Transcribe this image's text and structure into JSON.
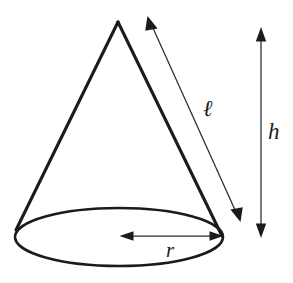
{
  "figure": {
    "kind": "geometry-diagram",
    "shape": "cone",
    "background_color": "#ffffff",
    "stroke_color": "#1b1b1b",
    "label_color": "#1a1a1a"
  },
  "labels": {
    "slant_height": "ℓ",
    "height": "h",
    "radius": "r"
  },
  "geometry": {
    "apex": {
      "x": 118,
      "y": 22
    },
    "base_ellipse": {
      "cx": 119,
      "cy": 237,
      "rx": 104,
      "ry": 29
    },
    "left_base_point": {
      "x": 16,
      "y": 230
    },
    "right_base_point": {
      "x": 222,
      "y": 236
    },
    "slant_arrow": {
      "x1": 240,
      "y1": 222,
      "x2": 148,
      "y2": 18,
      "double_headed": true
    },
    "height_arrow": {
      "x1": 261,
      "y1": 28,
      "x2": 261,
      "y2": 237,
      "double_headed": true
    },
    "radius_arrow": {
      "x1": 121,
      "y1": 236,
      "x2": 222,
      "y2": 236,
      "double_headed": true
    }
  },
  "label_positions": {
    "slant_height": {
      "x": 203,
      "y": 116
    },
    "height": {
      "x": 268,
      "y": 139
    },
    "radius": {
      "x": 166,
      "y": 257
    }
  }
}
